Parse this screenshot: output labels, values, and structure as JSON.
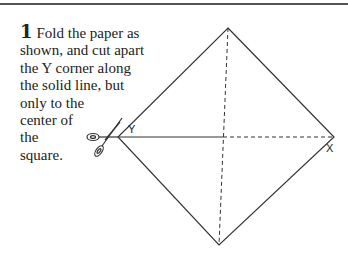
{
  "step": {
    "number": "1",
    "text_lines": [
      "Fold the paper as",
      "shown, and cut apart",
      "the Y corner along",
      "the solid line, but",
      "only to the",
      "center of",
      "the",
      "square."
    ]
  },
  "diagram": {
    "corner_labels": {
      "left": "Y",
      "right": "X"
    },
    "icons": [
      "scissors-icon"
    ],
    "line_color": "#333333"
  }
}
